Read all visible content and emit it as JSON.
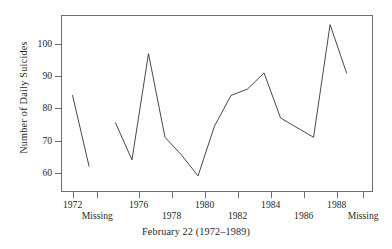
{
  "chart_data": {
    "type": "line",
    "title": "",
    "subtitle": "",
    "xlabel": "February 22 (1972–1989)",
    "ylabel": "Number of Daily Suicides",
    "grid": false,
    "legend": null,
    "legend_position": "none",
    "line_color": "#333333",
    "frame_color": "#6e6e6e",
    "xlim": [
      1971.3,
      1990.2
    ],
    "ylim": [
      54.0,
      109.0
    ],
    "yticks": [
      60,
      70,
      80,
      90,
      100
    ],
    "ytick_labels": [
      "60",
      "70",
      "80",
      "90",
      "100"
    ],
    "xticks": [
      1972,
      1973.5,
      1976,
      1978,
      1980,
      1982,
      1984,
      1986,
      1988,
      1989.6
    ],
    "xtick_labels": [
      "1972",
      "Missing",
      "1976",
      "1978",
      "1980",
      "1982",
      "1984",
      "1986",
      "1988",
      "Missing"
    ],
    "xtick_label_rows": [
      "a",
      "b",
      "a",
      "b",
      "a",
      "b",
      "a",
      "b",
      "a",
      "b"
    ],
    "x": [
      1972,
      1973,
      1974.6,
      1975.6,
      1976.6,
      1977.6,
      1978.6,
      1979.6,
      1980.6,
      1981.6,
      1982.6,
      1983.6,
      1984.6,
      1985.6,
      1986.6,
      1987.6,
      1988.6
    ],
    "series": [
      {
        "name": "Daily suicides",
        "values": [
          84,
          62,
          75.5,
          64,
          97,
          71,
          65.5,
          59,
          74.5,
          84,
          86,
          91,
          77,
          74,
          71,
          106,
          91
        ],
        "breaks_after_index": [
          1
        ]
      }
    ],
    "segments": [
      {
        "label": "segment-1",
        "points": [
          {
            "x": 1972,
            "y": 84
          },
          {
            "x": 1973,
            "y": 62
          }
        ]
      },
      {
        "label": "segment-2",
        "points": [
          {
            "x": 1974.6,
            "y": 75.5
          },
          {
            "x": 1975.6,
            "y": 64
          },
          {
            "x": 1976.6,
            "y": 97
          },
          {
            "x": 1977.6,
            "y": 71
          },
          {
            "x": 1978.6,
            "y": 65.5
          },
          {
            "x": 1979.6,
            "y": 59
          },
          {
            "x": 1980.6,
            "y": 74.5
          },
          {
            "x": 1981.6,
            "y": 84
          },
          {
            "x": 1982.6,
            "y": 86
          },
          {
            "x": 1983.6,
            "y": 91
          },
          {
            "x": 1984.6,
            "y": 77
          },
          {
            "x": 1985.6,
            "y": 74
          },
          {
            "x": 1986.6,
            "y": 71
          },
          {
            "x": 1987.6,
            "y": 106
          },
          {
            "x": 1988.6,
            "y": 91
          }
        ]
      }
    ]
  }
}
